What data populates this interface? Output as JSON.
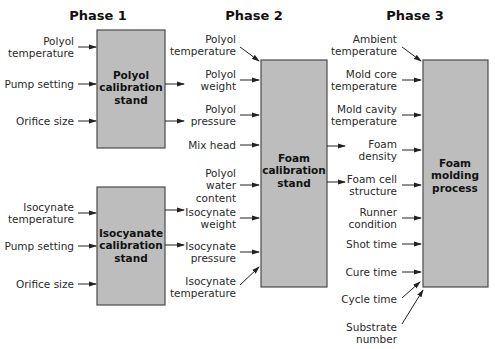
{
  "phases": [
    "Phase 1",
    "Phase 2",
    "Phase 3"
  ],
  "boxes": {
    "polyol_cal": [
      "Polyol",
      "calibration",
      "stand"
    ],
    "iso_cal": [
      "Isocyanate",
      "calibration",
      "stand"
    ],
    "foam_cal": [
      "Foam",
      "calibration",
      "stand"
    ],
    "foam_mold": [
      "Foam",
      "molding",
      "process"
    ]
  },
  "phase1": {
    "polyol_inputs": [
      [
        "Polyol",
        "temperature"
      ],
      [
        "Pump setting"
      ],
      [
        "Orifice size"
      ]
    ],
    "iso_inputs": [
      [
        "Isocynate",
        "temperature"
      ],
      [
        "Pump setting"
      ],
      [
        "Orifice size"
      ]
    ]
  },
  "phase2": {
    "inputs": [
      [
        "Polyol",
        "temperature"
      ],
      [
        "Polyol",
        "weight"
      ],
      [
        "Polyol",
        "pressure"
      ],
      [
        "Mix head"
      ],
      [
        "Polyol",
        "water",
        "content"
      ],
      [
        "Isocynate",
        "weight"
      ],
      [
        "Isocynate",
        "pressure"
      ],
      [
        "Isocynate",
        "temperature"
      ]
    ]
  },
  "phase3": {
    "inputs": [
      [
        "Ambient",
        "temperature"
      ],
      [
        "Mold core",
        "temperature"
      ],
      [
        "Mold cavity",
        "temperature"
      ],
      [
        "Foam",
        "density"
      ],
      [
        "Foam cell",
        "structure"
      ],
      [
        "Runner",
        "condition"
      ],
      [
        "Shot time"
      ],
      [
        "Cure time"
      ],
      [
        "Cycle time"
      ],
      [
        "Substrate",
        "number"
      ]
    ]
  }
}
